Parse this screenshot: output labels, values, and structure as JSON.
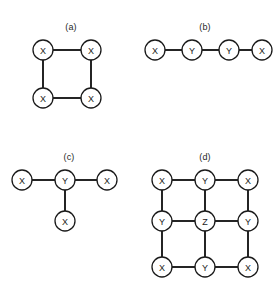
{
  "figure": {
    "width": 277,
    "height": 291,
    "background": "#ffffff",
    "ink_color": "#1a1a1a",
    "node_radius": 10,
    "node_fill": "#ffffff"
  },
  "panels": [
    {
      "id": "panel-a",
      "label": "(a)",
      "label_x": 71,
      "label_y": 22,
      "description": "four-cycle of X nodes",
      "nodes": [
        {
          "id": "a-tl",
          "label": "X",
          "x": 43,
          "y": 50
        },
        {
          "id": "a-tr",
          "label": "X",
          "x": 91,
          "y": 50
        },
        {
          "id": "a-bl",
          "label": "X",
          "x": 43,
          "y": 98
        },
        {
          "id": "a-br",
          "label": "X",
          "x": 91,
          "y": 98
        }
      ],
      "edges": [
        {
          "from": "a-tl",
          "to": "a-tr"
        },
        {
          "from": "a-tr",
          "to": "a-br"
        },
        {
          "from": "a-br",
          "to": "a-bl"
        },
        {
          "from": "a-bl",
          "to": "a-tl"
        }
      ]
    },
    {
      "id": "panel-b",
      "label": "(b)",
      "label_x": 205,
      "label_y": 22,
      "description": "four-node path X-Y-Y-X",
      "nodes": [
        {
          "id": "b-1",
          "label": "X",
          "x": 155,
          "y": 50
        },
        {
          "id": "b-2",
          "label": "Y",
          "x": 192,
          "y": 50
        },
        {
          "id": "b-3",
          "label": "Y",
          "x": 229,
          "y": 50
        },
        {
          "id": "b-4",
          "label": "X",
          "x": 262,
          "y": 50
        }
      ],
      "edges": [
        {
          "from": "b-1",
          "to": "b-2"
        },
        {
          "from": "b-2",
          "to": "b-3"
        },
        {
          "from": "b-3",
          "to": "b-4"
        }
      ]
    },
    {
      "id": "panel-c",
      "label": "(c)",
      "label_x": 69,
      "label_y": 152,
      "description": "star with central Y and three X leaves",
      "nodes": [
        {
          "id": "c-left",
          "label": "X",
          "x": 22,
          "y": 180
        },
        {
          "id": "c-center",
          "label": "Y",
          "x": 65,
          "y": 180
        },
        {
          "id": "c-right",
          "label": "X",
          "x": 107,
          "y": 180
        },
        {
          "id": "c-bottom",
          "label": "X",
          "x": 65,
          "y": 221
        }
      ],
      "edges": [
        {
          "from": "c-left",
          "to": "c-center"
        },
        {
          "from": "c-center",
          "to": "c-right"
        },
        {
          "from": "c-center",
          "to": "c-bottom"
        }
      ]
    },
    {
      "id": "panel-d",
      "label": "(d)",
      "label_x": 205,
      "label_y": 152,
      "description": "3x3 lattice with X corners, Y edges, Z center",
      "nodes": [
        {
          "id": "d-r0c0",
          "label": "X",
          "x": 162,
          "y": 180
        },
        {
          "id": "d-r0c1",
          "label": "Y",
          "x": 205,
          "y": 180
        },
        {
          "id": "d-r0c2",
          "label": "X",
          "x": 248,
          "y": 180
        },
        {
          "id": "d-r1c0",
          "label": "Y",
          "x": 162,
          "y": 221
        },
        {
          "id": "d-r1c1",
          "label": "Z",
          "x": 205,
          "y": 221
        },
        {
          "id": "d-r1c2",
          "label": "Y",
          "x": 248,
          "y": 221
        },
        {
          "id": "d-r2c0",
          "label": "X",
          "x": 162,
          "y": 267
        },
        {
          "id": "d-r2c1",
          "label": "Y",
          "x": 205,
          "y": 267
        },
        {
          "id": "d-r2c2",
          "label": "X",
          "x": 248,
          "y": 267
        }
      ],
      "edges": [
        {
          "from": "d-r0c0",
          "to": "d-r0c1"
        },
        {
          "from": "d-r0c1",
          "to": "d-r0c2"
        },
        {
          "from": "d-r1c0",
          "to": "d-r1c1"
        },
        {
          "from": "d-r1c1",
          "to": "d-r1c2"
        },
        {
          "from": "d-r2c0",
          "to": "d-r2c1"
        },
        {
          "from": "d-r2c1",
          "to": "d-r2c2"
        },
        {
          "from": "d-r0c0",
          "to": "d-r1c0"
        },
        {
          "from": "d-r1c0",
          "to": "d-r2c0"
        },
        {
          "from": "d-r0c1",
          "to": "d-r1c1"
        },
        {
          "from": "d-r1c1",
          "to": "d-r2c1"
        },
        {
          "from": "d-r0c2",
          "to": "d-r1c2"
        },
        {
          "from": "d-r1c2",
          "to": "d-r2c2"
        }
      ]
    }
  ]
}
